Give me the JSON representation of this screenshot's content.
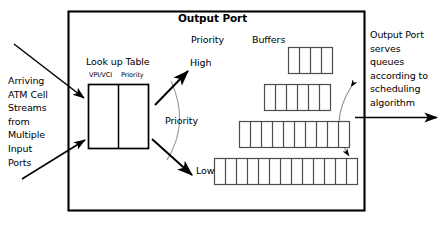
{
  "diagram": {
    "title": "Output Port",
    "outer_box": {
      "x": 68,
      "y": 11,
      "width": 296,
      "height": 199
    },
    "lookup_table": {
      "caption": "Look up Table",
      "columns": [
        "VPI/VCI",
        "Priority"
      ],
      "box": {
        "x": 88,
        "y": 84,
        "width": 60,
        "height": 64
      },
      "divider_x": 118
    },
    "priority_labels": {
      "heading": "Priority",
      "high": "High",
      "middle": "Priority",
      "low": "Low"
    },
    "buffers": {
      "caption": "Buffers",
      "queues": [
        {
          "name": "high-priority-queue",
          "cells": 4,
          "x": 288,
          "y": 47,
          "cell_width": 11,
          "height": 26
        },
        {
          "name": "second-queue",
          "cells": 6,
          "x": 264,
          "y": 84,
          "cell_width": 11,
          "height": 26
        },
        {
          "name": "third-queue",
          "cells": 10,
          "x": 239,
          "y": 121,
          "cell_width": 11,
          "height": 26
        },
        {
          "name": "low-priority-queue",
          "cells": 13,
          "x": 214,
          "y": 158,
          "cell_width": 11,
          "height": 26
        }
      ]
    },
    "annotations": {
      "left": "Arriving\nATM Cell\nStreams\nfrom\nMultiple\nInput\nPorts",
      "right": "Output Port\nserves\nqueues\naccording to\nscheduling\nalgorithm"
    },
    "arrows": {
      "input_upper": "arrow-arriving-cells-upper",
      "input_lower": "arrow-arriving-cells-lower",
      "to_high": "arrow-to-high-priority",
      "to_low": "arrow-to-low-priority",
      "output": "arrow-output-link",
      "arc_left": "priority-arc",
      "arc_right": "scheduler-arc"
    },
    "colors": {
      "stroke": "#000000",
      "arc": "#8c8c8c",
      "cell_stroke": "#4d4d4d",
      "background": "#ffffff"
    }
  }
}
